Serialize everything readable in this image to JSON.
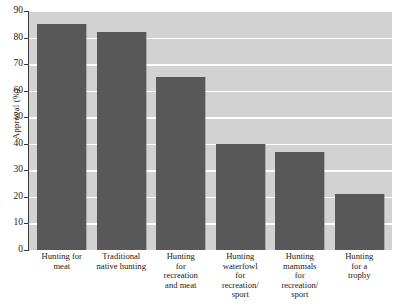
{
  "chart_data": {
    "type": "bar",
    "title": "",
    "subtitle": "",
    "xlabel": "",
    "ylabel": "Approval (%)",
    "ylim": [
      0,
      90
    ],
    "ytick_step": 10,
    "yticks": [
      90,
      80,
      70,
      60,
      50,
      40,
      30,
      20,
      10,
      0
    ],
    "grid": true,
    "grid_axis": "y",
    "legend": false,
    "legend_position": "none",
    "categories": [
      "Hunting for meat",
      "Traditional native hunting",
      "Hunting for recreation and meat",
      "Hunting waterfowl for recreation/ sport",
      "Hunting mammals for recreation/ sport",
      "Hunting for a trophy"
    ],
    "category_lines": [
      [
        "Hunting for",
        "meat"
      ],
      [
        "Traditional",
        "native hunting"
      ],
      [
        "Hunting",
        "for",
        "recreation",
        "and meat"
      ],
      [
        "Hunting",
        "waterfowl",
        "for",
        "recreation/",
        "sport"
      ],
      [
        "Hunting",
        "mammals",
        "for",
        "recreation/",
        "sport"
      ],
      [
        "Hunting",
        "for a",
        "trophy"
      ]
    ],
    "values": [
      85,
      82,
      65,
      40,
      37,
      21
    ],
    "colors": {
      "bar": "#585858",
      "plot_background": "#d2d2d2",
      "gridline": "#fdfdfd",
      "axis": "#3a3a3a",
      "figure_background": "#ffffff",
      "text": "#1a1a1a"
    }
  }
}
